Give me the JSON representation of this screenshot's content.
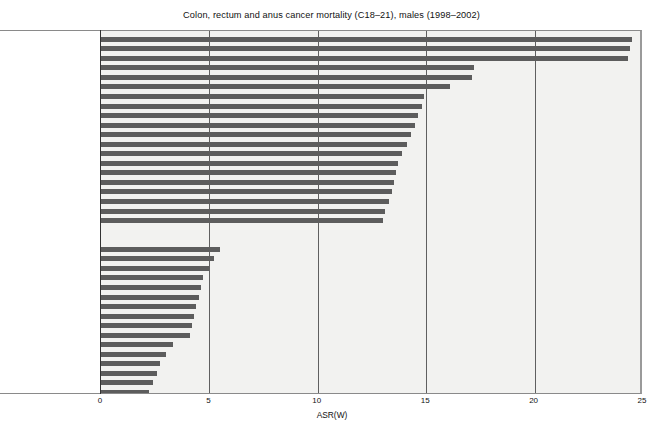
{
  "chart_data": {
    "type": "bar",
    "orientation": "horizontal",
    "title": "Colon, rectum and anus cancer mortality (C18–21), males (1998–2002)",
    "xlabel": "ASR(W)",
    "ylabel": "",
    "xlim": [
      0,
      25
    ],
    "xticks": [
      0,
      5,
      10,
      15,
      20,
      25
    ],
    "xtick_labels": [
      "0",
      "5",
      "10",
      "15",
      "20",
      "25"
    ],
    "grid": "vertical",
    "legend": "none",
    "bar_color": "#5d5d5d",
    "plot_background": "#f2f2f0",
    "groups": [
      {
        "name": "highest-mortality-group",
        "categories": [
          "Slovakia",
          "Hungary",
          "Czech Republic",
          "Croatia",
          "Slovenia",
          "New Zealand",
          "Ukraine",
          "Russian Federation",
          "Ireland",
          "Belarus",
          "Denmark",
          "UK, Scotland",
          "Latvia",
          "Lithuania",
          "Bulgaria",
          "Singapore",
          "Portugal",
          "Germany",
          "Estonia",
          "Austria"
        ],
        "values": [
          24.5,
          24.4,
          24.3,
          17.2,
          17.1,
          16.1,
          14.9,
          14.8,
          14.6,
          14.5,
          14.3,
          14.1,
          13.9,
          13.7,
          13.6,
          13.5,
          13.4,
          13.3,
          13.1,
          13.0
        ]
      },
      {
        "name": "lowest-mortality-group",
        "categories": [
          "Kyrgyzstan",
          "Costa Rice",
          "Chile",
          "South Africa",
          "Mauritius",
          "Azerbaijan",
          "Venezuela",
          "Brazil",
          "Panama",
          "Colombia",
          "Kuwait",
          "Uzbekistan",
          "Mexico",
          "Tajikistan",
          "Albania",
          "Ecuador",
          "Belize",
          "Guatemala",
          "Nicaragua",
          "El Salvador"
        ],
        "values": [
          5.5,
          5.2,
          5.0,
          4.7,
          4.6,
          4.5,
          4.4,
          4.3,
          4.2,
          4.1,
          3.3,
          3.0,
          2.7,
          2.6,
          2.4,
          2.2,
          2.1,
          1.8,
          1.7,
          1.5
        ]
      }
    ],
    "group_gap_rows": 1.6
  }
}
